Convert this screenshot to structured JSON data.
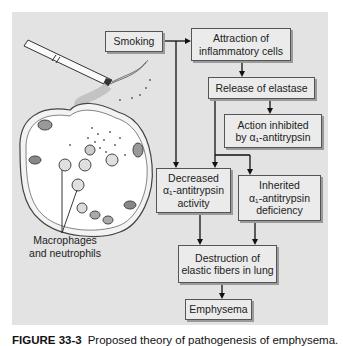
{
  "diagram": {
    "title": "Pathogenesis of emphysema",
    "nodes": {
      "smoking": "Smoking",
      "attraction": [
        "Attraction of",
        "inflammatory cells"
      ],
      "release": "Release of elastase",
      "action": [
        "Action inhibited",
        "by α₁-antitrypsin"
      ],
      "decreased": [
        "Decreased",
        "α₁-antitrypsin",
        "activity"
      ],
      "inherited": [
        "Inherited",
        "α₁-antitrypsin",
        "deficiency"
      ],
      "destruction": [
        "Destruction of",
        "elastic fibers in lung"
      ],
      "emphysema": "Emphysema"
    },
    "edges": [
      [
        "smoking",
        "attraction"
      ],
      [
        "smoking",
        "decreased"
      ],
      [
        "attraction",
        "release"
      ],
      [
        "release",
        "action"
      ],
      [
        "release",
        "decreased"
      ],
      [
        "release",
        "inherited"
      ],
      [
        "decreased",
        "destruction"
      ],
      [
        "inherited",
        "destruction"
      ],
      [
        "destruction",
        "emphysema"
      ]
    ],
    "illustration_label": [
      "Macrophages",
      "and neutrophils"
    ],
    "colors": {
      "panel": "#e3e3e3",
      "box": "#ebebeb",
      "border": "#555555",
      "line": "#111111"
    }
  },
  "caption": {
    "figure_number": "FIGURE 33-3",
    "text": "Proposed theory of pathogenesis of emphysema."
  }
}
